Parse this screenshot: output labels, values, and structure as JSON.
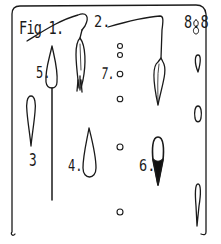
{
  "figure": {
    "title": "Fig 1.",
    "labels": {
      "fig2": "2.",
      "fig3": "3",
      "fig4": "4.",
      "fig5": "5.",
      "fig6": "6.",
      "fig7": "7.",
      "fig8": "8.8"
    },
    "ink_color": "#1a1a1a",
    "paper_color": "#ffffff",
    "parts": [
      {
        "id": "2",
        "shape": "elongated seed on curved stalk"
      },
      {
        "id": "3",
        "shape": "open teardrop, point down"
      },
      {
        "id": "4",
        "shape": "open teardrop, point up"
      },
      {
        "id": "5",
        "shape": "teardrop on long straight stalk"
      },
      {
        "id": "6",
        "shape": "teardrop, lower half filled black"
      },
      {
        "id": "7",
        "shape": "column of small circles"
      },
      {
        "id": "8",
        "shape": "column of small teardrops"
      }
    ]
  }
}
